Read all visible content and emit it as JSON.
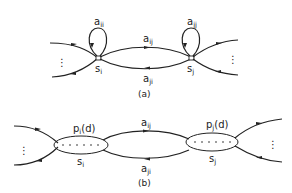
{
  "diagram_a": {
    "caption": "(a)",
    "nodes": [
      {
        "id": "s_i",
        "label": "s",
        "sub": "i"
      },
      {
        "id": "s_j",
        "label": "s",
        "sub": "j"
      }
    ],
    "edges": [
      {
        "from": "s_i",
        "to": "s_i",
        "label": "a",
        "sub": "ii",
        "type": "self-loop"
      },
      {
        "from": "s_j",
        "to": "s_j",
        "label": "a",
        "sub": "jj",
        "type": "self-loop"
      },
      {
        "from": "s_i",
        "to": "s_j",
        "label": "a",
        "sub": "ij"
      },
      {
        "from": "s_j",
        "to": "s_i",
        "label": "a",
        "sub": "ji"
      }
    ],
    "ellipsis": "⋮"
  },
  "diagram_b": {
    "caption": "(b)",
    "nodes": [
      {
        "id": "s_i",
        "label": "s",
        "sub": "i",
        "duration_label": "p",
        "duration_sub": "i",
        "duration_arg": "(d)"
      },
      {
        "id": "s_j",
        "label": "s",
        "sub": "j",
        "duration_label": "p",
        "duration_sub": "j",
        "duration_arg": "(d)"
      }
    ],
    "edges": [
      {
        "from": "s_i",
        "to": "s_j",
        "label": "a",
        "sub": "ij"
      },
      {
        "from": "s_j",
        "to": "s_i",
        "label": "a",
        "sub": "ji"
      }
    ],
    "ellipsis": "⋮"
  }
}
